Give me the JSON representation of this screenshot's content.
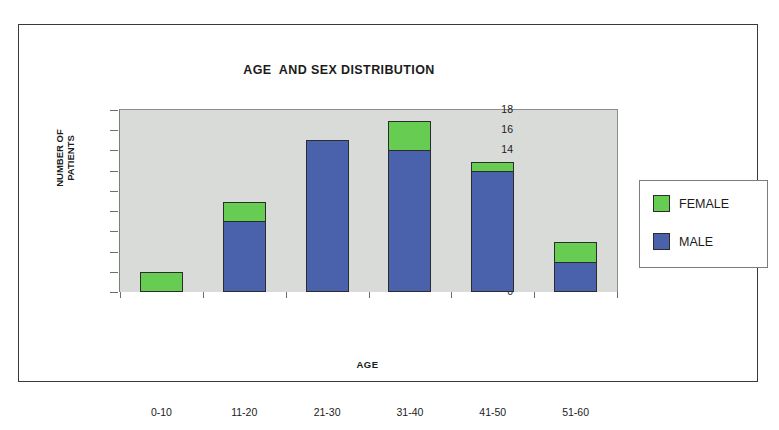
{
  "chart_data": {
    "type": "bar",
    "title": "AGE  AND SEX DISTRIBUTION",
    "xlabel": "AGE",
    "ylabel": "NUMBER OF PATIENTS",
    "ylabel_lines": [
      "NUMBER OF",
      "PATIENTS"
    ],
    "categories": [
      "0-10",
      "11-20",
      "21-30",
      "31-40",
      "41-50",
      "51-60"
    ],
    "stacked": true,
    "ylim": [
      0,
      18
    ],
    "yticks": [
      0,
      2,
      4,
      6,
      8,
      10,
      12,
      14,
      16,
      18
    ],
    "grid": false,
    "legend_position": "right",
    "series": [
      {
        "name": "MALE",
        "color": "#4a62ac",
        "values": [
          0,
          7,
          15,
          14,
          12,
          3
        ]
      },
      {
        "name": "FEMALE",
        "color": "#66cc52",
        "values": [
          2,
          2,
          0,
          3,
          1,
          2
        ]
      }
    ],
    "totals": [
      2,
      9,
      15,
      17,
      13,
      5
    ],
    "plot_background": "#d9dbd9",
    "page_background": "#ffffff"
  },
  "legend": {
    "items": [
      {
        "label": "FEMALE",
        "color": "#66cc52"
      },
      {
        "label": "MALE",
        "color": "#4a62ac"
      }
    ]
  }
}
